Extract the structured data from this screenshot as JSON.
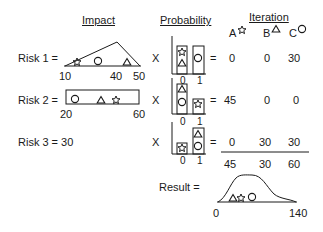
{
  "headers": {
    "impact": "Impact",
    "probability": "Probability",
    "iteration": "Iteration"
  },
  "iterations": [
    {
      "label": "A",
      "marker": "star"
    },
    {
      "label": "B",
      "marker": "triangle"
    },
    {
      "label": "C",
      "marker": "circle"
    }
  ],
  "risks": [
    {
      "label": "Risk 1 =",
      "impact_type": "triangular",
      "min": "10",
      "mode": "40",
      "max": "50",
      "times": "X",
      "prob_ticks": [
        "0",
        "1"
      ],
      "equals": "=",
      "values": [
        "0",
        "0",
        "30"
      ]
    },
    {
      "label": "Risk 2 =",
      "impact_type": "uniform",
      "min": "20",
      "max": "60",
      "times": "X",
      "prob_ticks": [
        "0",
        "1"
      ],
      "equals": "=",
      "values": [
        "45",
        "0",
        "0"
      ]
    },
    {
      "label": "Risk 3 = 30",
      "impact_type": "constant",
      "times": "X",
      "prob_ticks": [
        "0",
        "1"
      ],
      "equals": "=",
      "values": [
        "0",
        "30",
        "30"
      ]
    }
  ],
  "totals": [
    "45",
    "30",
    "60"
  ],
  "result": {
    "label": "Result =",
    "min": "0",
    "max": "140"
  }
}
